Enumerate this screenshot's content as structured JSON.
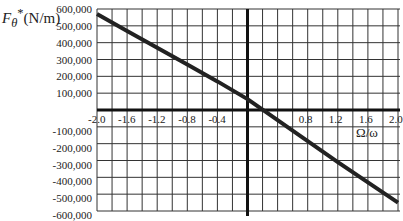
{
  "chart_data": {
    "type": "line",
    "title": "",
    "xlabel": "Ω/ω",
    "ylabel": "Fθ*(N/m)",
    "ylabel_parts": {
      "symbol": "F",
      "subscript": "θ",
      "superscript": "*",
      "unit": "(N/m)"
    },
    "xlim": [
      -2.0,
      2.0
    ],
    "ylim": [
      -600000,
      600000
    ],
    "grid": true,
    "x_grid_step": 0.2,
    "y_grid_step": 100000,
    "x_ticks": [
      "-2.0",
      "-1.6",
      "-1.2",
      "-0.8",
      "-0.4",
      "0.8",
      "1.2",
      "1.6",
      "2.0"
    ],
    "x_tick_values": [
      -2.0,
      -1.6,
      -1.2,
      -0.8,
      -0.4,
      0.8,
      1.2,
      1.6,
      2.0
    ],
    "y_ticks": [
      "600,000",
      "500,000",
      "400,000",
      "300,000",
      "200,000",
      "100,000",
      "-100,000",
      "-200,000",
      "-300,000",
      "-400,000",
      "-500,000",
      "-600,000"
    ],
    "y_tick_values": [
      600000,
      500000,
      400000,
      300000,
      200000,
      100000,
      -100000,
      -200000,
      -300000,
      -400000,
      -500000,
      -600000
    ],
    "series": [
      {
        "name": "Fθ*",
        "x": [
          -2.0,
          -1.6,
          -1.2,
          -0.8,
          -0.4,
          0.0,
          0.4,
          0.8,
          1.2,
          1.6,
          2.0
        ],
        "values": [
          570000,
          470000,
          370000,
          270000,
          170000,
          65000,
          -60000,
          -185000,
          -310000,
          -430000,
          -550000
        ]
      }
    ],
    "colors": {
      "line": "#222222",
      "grid": "#333333",
      "axis": "#111111"
    }
  }
}
